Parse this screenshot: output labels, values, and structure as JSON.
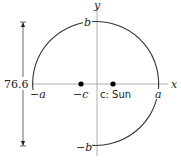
{
  "diagram": {
    "type": "ellipse-orbit",
    "axes": {
      "x_label": "x",
      "y_label": "y"
    },
    "vertices": {
      "right": "a",
      "left": "−a",
      "top": "b",
      "bottom": "−b"
    },
    "foci": [
      {
        "label": "−c",
        "position": "left"
      },
      {
        "label": "c: Sun",
        "position": "right"
      }
    ],
    "dimension": {
      "label": "76.6",
      "orientation": "vertical",
      "spans": "minor axis"
    },
    "colors": {
      "stroke": "#333333",
      "axis": "#888888",
      "dot": "#000000"
    }
  }
}
